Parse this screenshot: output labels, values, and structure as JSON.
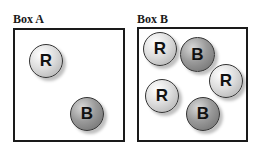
{
  "boxes": [
    {
      "label": "Box A",
      "balls": [
        {
          "letter": "R",
          "type": "R"
        },
        {
          "letter": "B",
          "type": "B"
        }
      ]
    },
    {
      "label": "Box B",
      "balls": [
        {
          "letter": "R",
          "type": "R"
        },
        {
          "letter": "B",
          "type": "B"
        },
        {
          "letter": "R",
          "type": "R"
        },
        {
          "letter": "R",
          "type": "R"
        },
        {
          "letter": "B",
          "type": "B"
        }
      ]
    }
  ],
  "colors": {
    "light_ball": "#dedede",
    "dark_ball": "#9a9a9a",
    "border": "#1a1a1a"
  }
}
